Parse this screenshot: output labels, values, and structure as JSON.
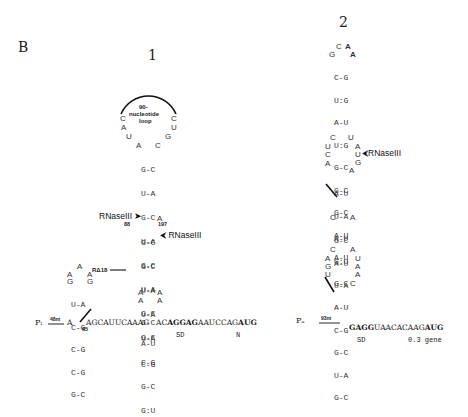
{
  "panel_label": "B",
  "structures": [
    {
      "title": "1",
      "loop_label_line1": "90-",
      "loop_label_line2": "nucleotide",
      "loop_label_line3": "loop",
      "loop_left": [
        "C",
        "A",
        "U",
        "A"
      ],
      "loop_right": [
        "C",
        "U",
        "G",
        "C"
      ],
      "stem_upper": [
        "G-C",
        "U-A",
        "G-C",
        "U-A",
        "G-C",
        "U-A",
        "G-C",
        "G-C"
      ],
      "bulge": "A",
      "stem_mid": [
        "G-C",
        "G-C",
        "U-A",
        "U-A",
        "U-A",
        "C-G",
        "G-C",
        "G:U"
      ],
      "internal_loop_left": [
        "A",
        "A"
      ],
      "internal_loop_right": [
        "A",
        "A"
      ],
      "stem_lower": [
        "G-C",
        "A-U",
        "C-G"
      ],
      "hairpin_small_loop": [
        "A",
        "A",
        "G",
        "G",
        "A"
      ],
      "hairpin_small_stem": [
        "U-A",
        "C-G",
        "C-G",
        "C-G",
        "G-C"
      ],
      "annotations": {
        "rnase_left": "RNaseIII",
        "rnase_left_pos": "88",
        "rnase_right": "RNaseIII",
        "rnase_right_pos": "197",
        "deletion": "RΔ18",
        "pos_65": "65",
        "promoter": "Pₗ",
        "spacer": "48nt"
      },
      "sequence": {
        "start": "A",
        "linker": "AGCAUUCAAAG",
        "pre_sd": "AC",
        "sd": "AGGAG",
        "mid": "AAUCCAG",
        "start_codon": "AUG",
        "sd_label": "SD",
        "gene_label": "N"
      }
    },
    {
      "title": "2",
      "loop_top": [
        "C",
        "A"
      ],
      "loop_left": "G",
      "loop_right": "A",
      "stem_top": [
        "C-G",
        "U:G",
        "A-U",
        "U:G",
        "G-C",
        "G-C",
        "G-C",
        "A-U",
        "A-U"
      ],
      "internal_loop1_left": [
        "C",
        "U",
        "C",
        "A"
      ],
      "internal_loop1_right": [
        "U",
        "A",
        "U",
        "G",
        "A"
      ],
      "stem_middle": [
        "A-U",
        "U-A",
        "A-U",
        "G:U",
        "G-C"
      ],
      "bulge_left": "C",
      "bulge_right": "A",
      "stem_middle2": [
        "G-C",
        "A-U",
        "U-A"
      ],
      "internal_loop2_left": [
        "C",
        "A",
        "G",
        "U"
      ],
      "internal_loop2_right": [
        "A",
        "U",
        "A",
        "A",
        "C"
      ],
      "stem_bottom": [
        "A-U",
        "C-G",
        "G-C",
        "U-A",
        "G-C"
      ],
      "annotations": {
        "rnase": "RNaseIII",
        "promoter": "Pₐ",
        "spacer": "93nt"
      },
      "sequence": {
        "sd": "GAGG",
        "mid": "UAACACAAG",
        "start_codon": "AUG",
        "sd_label": "SD",
        "gene_label": "0.3 gene"
      }
    }
  ]
}
